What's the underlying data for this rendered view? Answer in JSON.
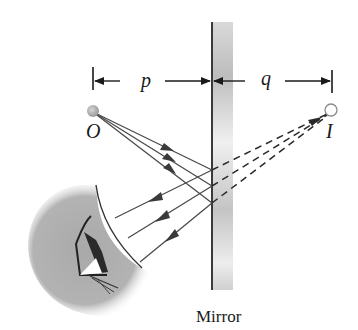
{
  "figure": {
    "labels": {
      "object": "O",
      "image": "I",
      "object_distance": "p",
      "image_distance": "q",
      "mirror": "Mirror"
    },
    "colors": {
      "ray": "#4a4a4a",
      "mirror_line": "#3a3a3a",
      "mirror_shade": "#bdbdbd",
      "head": "#a8a8a8",
      "object_point": "#b5b5b5",
      "image_point": "#ffffff"
    },
    "geometry": {
      "mirror_x": 212,
      "object": [
        93,
        112
      ],
      "image": [
        331,
        112
      ],
      "reflection_points": [
        [
          212,
          170
        ],
        [
          212,
          186
        ],
        [
          212,
          203
        ]
      ],
      "reflected_ray_ends": [
        [
          115,
          218
        ],
        [
          128,
          238
        ],
        [
          140,
          262
        ]
      ]
    },
    "elements": [
      "dimension arrow p from object to mirror",
      "dimension arrow q from mirror to image",
      "three incident rays from O to mirror",
      "three reflected rays toward eye",
      "three dashed virtual rays extending back to I",
      "observer eye"
    ]
  }
}
